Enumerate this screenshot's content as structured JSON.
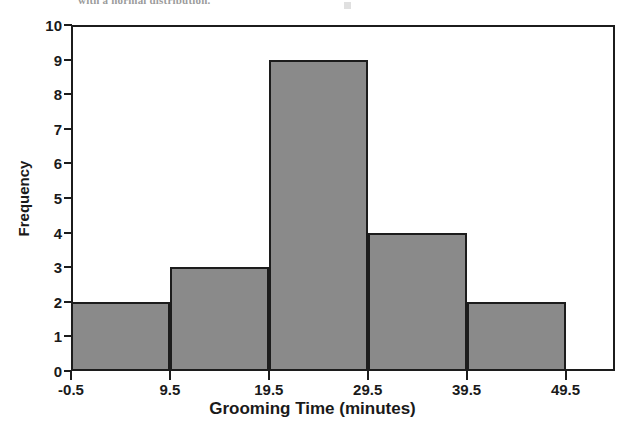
{
  "figure": {
    "background_color": "#ffffff",
    "top_text_fragment": "with a normal distribution.",
    "axis_color": "#1c1c1c"
  },
  "chart_data": {
    "type": "bar",
    "title": "",
    "subtitle": "",
    "xlabel": "Grooming Time (minutes)",
    "ylabel": "Frequency",
    "bar_color": "#8a8a8a",
    "bar_edge_color": "#1c1c1c",
    "grid": false,
    "legend": null,
    "legend_position": "none",
    "xlim": [
      -0.5,
      54.5
    ],
    "ylim": [
      0,
      10
    ],
    "xticks": [
      -0.5,
      9.5,
      19.5,
      29.5,
      39.5,
      49.5
    ],
    "xticklabels": [
      "-0.5",
      "9.5",
      "19.5",
      "29.5",
      "39.5",
      "49.5"
    ],
    "yticks": [
      0,
      1,
      2,
      3,
      4,
      5,
      6,
      7,
      8,
      9,
      10
    ],
    "yticklabels": [
      "0",
      "1",
      "2",
      "3",
      "4",
      "5",
      "6",
      "7",
      "8",
      "9",
      "10"
    ],
    "bin_edges": [
      -0.5,
      9.5,
      19.5,
      29.5,
      39.5,
      49.5
    ],
    "categories": [
      "-0.5 to 9.5",
      "9.5 to 19.5",
      "19.5 to 29.5",
      "29.5 to 39.5",
      "39.5 to 49.5"
    ],
    "values": [
      2,
      3,
      9,
      4,
      2
    ],
    "bars": [
      {
        "label": "-0.5 to 9.5",
        "x0": -0.5,
        "x1": 9.5,
        "value": 2
      },
      {
        "label": "9.5 to 19.5",
        "x0": 9.5,
        "x1": 19.5,
        "value": 3
      },
      {
        "label": "19.5 to 29.5",
        "x0": 19.5,
        "x1": 29.5,
        "value": 9
      },
      {
        "label": "29.5 to 39.5",
        "x0": 29.5,
        "x1": 39.5,
        "value": 4
      },
      {
        "label": "39.5 to 49.5",
        "x0": 39.5,
        "x1": 49.5,
        "value": 2
      }
    ]
  }
}
